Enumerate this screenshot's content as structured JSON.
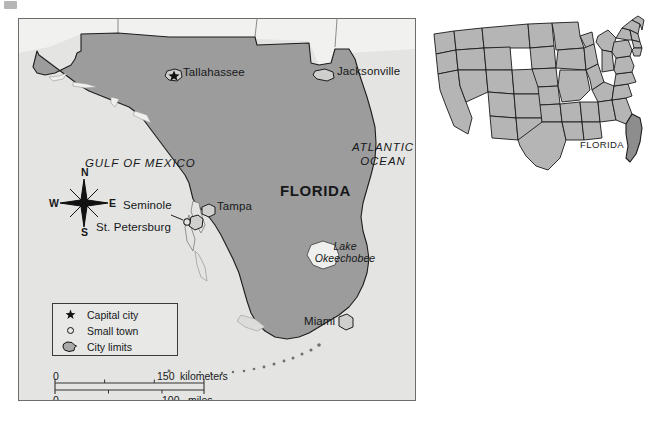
{
  "document": {
    "type": "reference-map",
    "title": "Florida reference map with United States locator inset"
  },
  "main_map": {
    "state_label": "FLORIDA",
    "water_labels": [
      {
        "name": "gulf-of-mexico",
        "text": "GULF OF MEXICO"
      },
      {
        "name": "atlantic-ocean",
        "line1": "ATLANTIC",
        "line2": "OCEAN"
      },
      {
        "name": "lake-okeechobee",
        "line1": "Lake",
        "line2": "Okeechobee"
      }
    ],
    "cities": [
      {
        "name": "tallahassee",
        "label": "Tallahassee",
        "symbol": "capital-star-with-city-limits"
      },
      {
        "name": "jacksonville",
        "label": "Jacksonville",
        "symbol": "city-limits"
      },
      {
        "name": "tampa",
        "label": "Tampa",
        "symbol": "city-limits"
      },
      {
        "name": "seminole",
        "label": "Seminole",
        "symbol": "small-town-circle"
      },
      {
        "name": "st-petersburg",
        "label": "St. Petersburg",
        "symbol": "city-limits"
      },
      {
        "name": "miami",
        "label": "Miami",
        "symbol": "city-limits"
      }
    ],
    "compass": {
      "north": "N",
      "south": "S",
      "east": "E",
      "west": "W"
    },
    "legend": {
      "items": [
        {
          "symbol": "star",
          "label": "Capital city"
        },
        {
          "symbol": "open-circle",
          "label": "Small town"
        },
        {
          "symbol": "polygon",
          "label": "City limits"
        }
      ]
    },
    "scale_bar": {
      "km_zero": "0",
      "km_max": "150",
      "km_unit": "kilometers",
      "mi_zero": "0",
      "mi_max": "100",
      "mi_unit": "miles"
    }
  },
  "inset_map": {
    "name": "united-states-locator",
    "highlight_label": "FLORIDA"
  },
  "colors": {
    "paper": "#ffffff",
    "map_background": "#e4e4e2",
    "water": "#e4e4e2",
    "land_fill": "#9c9c9c",
    "inset_state_fill": "#b5b5b5",
    "inset_highlight_fill": "#8d8d8d",
    "outline": "#1a1a1a",
    "frame": "#6d6d6d",
    "text": "#16181a"
  }
}
